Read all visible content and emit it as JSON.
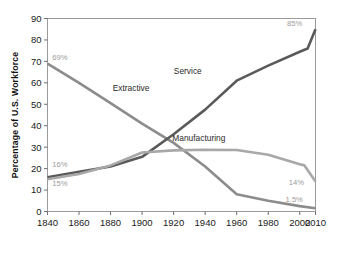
{
  "chart_data": {
    "type": "line",
    "title": "",
    "xlabel": "",
    "ylabel": "Percentage of U.S. Workforce",
    "xlim": [
      1840,
      2010
    ],
    "ylim": [
      0,
      90
    ],
    "grid": false,
    "legend_position": "inline-labels",
    "x_ticks": [
      "1840",
      "1860",
      "1880",
      "1900",
      "1920",
      "1940",
      "1960",
      "1980",
      "2000",
      "2010"
    ],
    "x_tick_values": [
      1840,
      1860,
      1880,
      1900,
      1920,
      1940,
      1960,
      1980,
      2000,
      2010
    ],
    "y_ticks": [
      "0",
      "10",
      "20",
      "30",
      "40",
      "50",
      "60",
      "70",
      "80",
      "90"
    ],
    "y_tick_values": [
      0,
      10,
      20,
      30,
      40,
      50,
      60,
      70,
      80,
      90
    ],
    "series": [
      {
        "name": "Extractive",
        "color": "#8c8c8c",
        "label_x": 1893,
        "label_y": 56,
        "start_label": "69%",
        "end_label": "1.5%",
        "x": [
          1840,
          1860,
          1880,
          1900,
          1920,
          1940,
          1960,
          1980,
          2000,
          2010
        ],
        "values": [
          69,
          60,
          50.5,
          41,
          32,
          21,
          8,
          5,
          2.5,
          1.5
        ]
      },
      {
        "name": "Service",
        "color": "#5a5a5a",
        "label_x": 1929,
        "label_y": 64,
        "start_label": "16%",
        "end_label": "85%",
        "x": [
          1840,
          1860,
          1880,
          1900,
          1920,
          1940,
          1960,
          1980,
          2000,
          2005,
          2010
        ],
        "values": [
          16,
          18.5,
          21,
          25.5,
          36,
          47.5,
          61,
          68,
          74.5,
          76,
          85
        ]
      },
      {
        "name": "Manufacturing",
        "color": "#a8a8a8",
        "label_x": 1936,
        "label_y": 33,
        "start_label": "15%",
        "end_label": "14%",
        "x": [
          1840,
          1860,
          1880,
          1900,
          1920,
          1940,
          1960,
          1980,
          2000,
          2003,
          2010
        ],
        "values": [
          15,
          17.5,
          21.5,
          27.5,
          28.5,
          28.8,
          28.7,
          26.5,
          22,
          21.5,
          14
        ]
      }
    ],
    "annotations": [
      {
        "text": "69%",
        "x": 1843,
        "y": 70.5,
        "series": "Extractive",
        "position": "start"
      },
      {
        "text": "16%",
        "x": 1843,
        "y": 20.6,
        "series": "Service",
        "position": "start"
      },
      {
        "text": "15%",
        "x": 1843,
        "y": 11.8,
        "series": "Manufacturing",
        "position": "start"
      },
      {
        "text": "85%",
        "x": 1992,
        "y": 86.5,
        "series": "Service",
        "position": "end"
      },
      {
        "text": "14%",
        "x": 1993,
        "y": 12.5,
        "series": "Manufacturing",
        "position": "end"
      },
      {
        "text": "1.5%",
        "x": 1991,
        "y": 4.5,
        "series": "Extractive",
        "position": "end"
      }
    ]
  }
}
